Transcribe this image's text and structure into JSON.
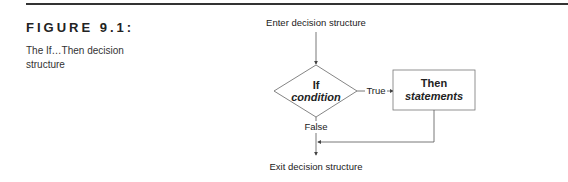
{
  "figure": {
    "label": "FIGURE 9.1:",
    "caption": "The If…Then decision structure"
  },
  "diagram": {
    "entry_label": "Enter decision structure",
    "exit_label": "Exit decision structure",
    "decision": {
      "title": "If",
      "subtitle": "condition"
    },
    "process": {
      "title": "Then",
      "subtitle": "statements"
    },
    "true_label": "True",
    "false_label": "False",
    "line_color": "#555555"
  }
}
